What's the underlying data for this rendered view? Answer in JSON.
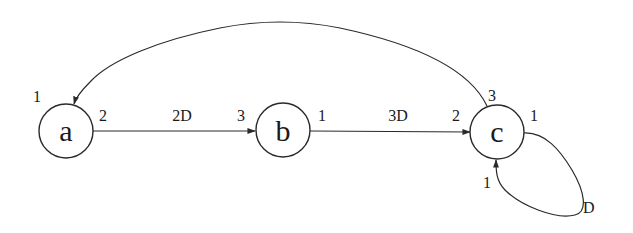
{
  "diagram": {
    "type": "port-graph",
    "nodes": [
      {
        "id": "a",
        "label": "a",
        "cx": 66,
        "cy": 131,
        "r": 27
      },
      {
        "id": "b",
        "label": "b",
        "cx": 283,
        "cy": 130,
        "r": 27
      },
      {
        "id": "c",
        "label": "c",
        "cx": 497,
        "cy": 132,
        "r": 27
      }
    ],
    "edges": [
      {
        "id": "a-b",
        "from": "a",
        "from_port": "2",
        "to": "b",
        "to_port": "3",
        "label": "2D"
      },
      {
        "id": "b-c",
        "from": "b",
        "from_port": "1",
        "to": "c",
        "to_port": "2",
        "label": "3D"
      },
      {
        "id": "c-a",
        "from": "c",
        "from_port": "3",
        "to": "a",
        "to_port": "1",
        "label": ""
      },
      {
        "id": "c-c",
        "from": "c",
        "from_port": "1",
        "to": "c",
        "to_port": "1",
        "label": "D"
      }
    ],
    "port_labels": {
      "a_top": "1",
      "a_right": "2",
      "b_left": "3",
      "b_right": "1",
      "c_left": "2",
      "c_top": "3",
      "c_right": "1",
      "c_bottom": "1"
    },
    "edge_labels": {
      "ab": "2D",
      "bc": "3D",
      "loop": "D"
    }
  }
}
